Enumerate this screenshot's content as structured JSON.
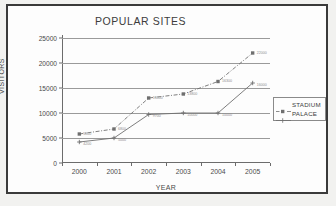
{
  "chart_data": {
    "type": "line",
    "title": "POPULAR SITES",
    "xlabel": "YEAR",
    "ylabel": "VISITORS",
    "categories": [
      "2000",
      "2001",
      "2002",
      "2003",
      "2004",
      "2005"
    ],
    "x": [
      2000,
      2001,
      2002,
      2003,
      2004,
      2005
    ],
    "ylim": [
      0,
      25000
    ],
    "yticks": [
      "0",
      "5000",
      "10000",
      "15000",
      "20000",
      "25000"
    ],
    "ytick_values": [
      0,
      5000,
      10000,
      15000,
      20000,
      25000
    ],
    "grid": "horizontal",
    "legend_position": "right",
    "series": [
      {
        "name": "STADIUM",
        "marker": "square",
        "line_style": "dash-dot",
        "color": "#6f6f6f",
        "values": [
          5800,
          6800,
          13000,
          13800,
          16300,
          22000
        ],
        "point_labels": [
          "5800",
          "6800",
          "13000",
          "13800",
          "16300",
          "22000"
        ]
      },
      {
        "name": "PALACE",
        "marker": "plus",
        "line_style": "solid",
        "color": "#6f6f6f",
        "values": [
          4200,
          5000,
          9700,
          10000,
          10000,
          16000
        ],
        "point_labels": [
          "4200",
          "5000",
          "9700",
          "10000",
          "10000",
          "16000"
        ]
      }
    ]
  },
  "legend": {
    "items": [
      {
        "label": "STADIUM"
      },
      {
        "label": "PALACE"
      }
    ]
  }
}
